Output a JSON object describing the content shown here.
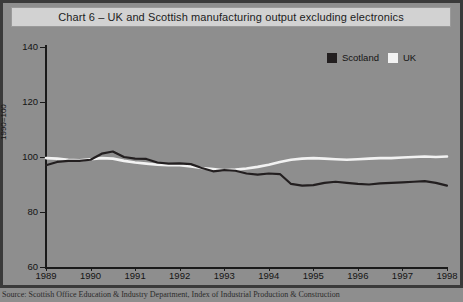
{
  "title": "Chart 6 – UK and Scottish manufacturing output excluding electronics",
  "source_note": "Source: Scottish Office Education & Industry Department, Index of Industrial Production & Construction",
  "colors": {
    "background": "#8e8e8e",
    "frame": "#3a3a3a",
    "title_plate": "#d2d2d2",
    "axis": "#1a1a1a",
    "scotland": "#231f20",
    "uk": "#f2f2f2"
  },
  "legend": {
    "position": "top-right-inside-plot",
    "entries": [
      {
        "label": "Scotland",
        "color": "#231f20"
      },
      {
        "label": "UK",
        "color": "#f2f2f2"
      }
    ]
  },
  "axes": {
    "y_label": "1990=100",
    "y_ticks": [
      "140",
      "120",
      "100",
      "80",
      "60"
    ],
    "x_ticks": [
      "1989",
      "1990",
      "1991",
      "1992",
      "1993",
      "1994",
      "1995",
      "1996",
      "1997",
      "1998"
    ]
  },
  "chart_data": {
    "type": "line",
    "title": "Chart 6 – UK and Scottish manufacturing output excluding electronics",
    "xlabel": "",
    "ylabel": "1990=100",
    "ylim": [
      60,
      140
    ],
    "yticks": [
      60,
      80,
      100,
      120,
      140
    ],
    "xlim": [
      1989,
      1998
    ],
    "xticks": [
      1989,
      1990,
      1991,
      1992,
      1993,
      1994,
      1995,
      1996,
      1997,
      1998
    ],
    "grid": false,
    "legend_position": "upper right",
    "x": [
      1989.0,
      1989.25,
      1989.5,
      1989.75,
      1990.0,
      1990.25,
      1990.5,
      1990.75,
      1991.0,
      1991.25,
      1991.5,
      1991.75,
      1992.0,
      1992.25,
      1992.5,
      1992.75,
      1993.0,
      1993.25,
      1993.5,
      1993.75,
      1994.0,
      1994.25,
      1994.5,
      1994.75,
      1995.0,
      1995.25,
      1995.5,
      1995.75,
      1996.0,
      1996.25,
      1996.5,
      1996.75,
      1997.0,
      1997.25,
      1997.5,
      1997.75,
      1998.0
    ],
    "series": [
      {
        "name": "Scotland",
        "color": "#231f20",
        "values": [
          97.0,
          98.2,
          98.6,
          98.6,
          99.0,
          101.2,
          102.0,
          100.0,
          99.4,
          99.3,
          98.0,
          97.6,
          97.7,
          97.4,
          96.0,
          94.8,
          95.2,
          95.0,
          94.0,
          93.6,
          94.0,
          93.8,
          90.2,
          89.6,
          89.8,
          90.6,
          91.0,
          90.6,
          90.2,
          90.0,
          90.4,
          90.6,
          90.8,
          91.0,
          91.2,
          90.6,
          89.6
        ]
      },
      {
        "name": "UK",
        "color": "#f2f2f2",
        "values": [
          99.6,
          99.4,
          99.0,
          98.8,
          99.2,
          99.6,
          99.4,
          98.6,
          98.0,
          97.6,
          97.2,
          97.0,
          97.0,
          96.6,
          96.0,
          95.6,
          95.2,
          95.4,
          95.8,
          96.4,
          97.2,
          98.2,
          99.0,
          99.4,
          99.6,
          99.4,
          99.2,
          99.0,
          99.2,
          99.4,
          99.6,
          99.6,
          99.8,
          100.0,
          100.2,
          100.0,
          100.2
        ]
      }
    ]
  }
}
